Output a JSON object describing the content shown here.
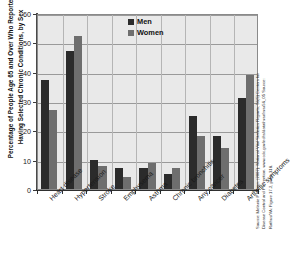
{
  "chart_data": {
    "type": "bar",
    "title": "",
    "ylabel": "Percentage of People Age 65 and Over Who Reported Having Selected Chronic Conditions, by Sex",
    "xlabel": "",
    "ylim": [
      0,
      60
    ],
    "yticks": [
      0,
      10,
      20,
      30,
      40,
      50,
      60
    ],
    "grid": true,
    "legend_position": "top-center",
    "categories": [
      "Heart disease",
      "Hypertension",
      "Stroke",
      "Emphysema",
      "Asthma",
      "Chronic bronchitis",
      "Any cancer",
      "Diabetes",
      "Arthritic symptoms"
    ],
    "series": [
      {
        "name": "Men",
        "color": "#2b2b2b",
        "values": [
          37,
          47,
          10,
          7,
          7,
          5,
          25,
          18,
          31
        ]
      },
      {
        "name": "Women",
        "color": "#6e6e6e",
        "values": [
          27,
          52,
          8,
          4,
          9,
          7,
          18,
          14,
          39
        ]
      }
    ]
  },
  "legend": {
    "items": [
      {
        "label": "Men"
      },
      {
        "label": "Women"
      }
    ]
  },
  "source": {
    "lines": [
      "Source: Melanie P Heron. (2007). National Vital Statistics Reports, 56(5) Centers for",
      "Disease Control and Prevention. www.cdc.gov/nchs/data/nvsr/nvsr56_05 Source:",
      "Rathus/VA: Figure 17.2, page 318."
    ]
  },
  "colors": {
    "men": "#2b2b2b",
    "women": "#6e6e6e",
    "plot_background": "#e9e9e9",
    "gridline": "#9a9a9a",
    "axis": "#2f2f2f"
  }
}
